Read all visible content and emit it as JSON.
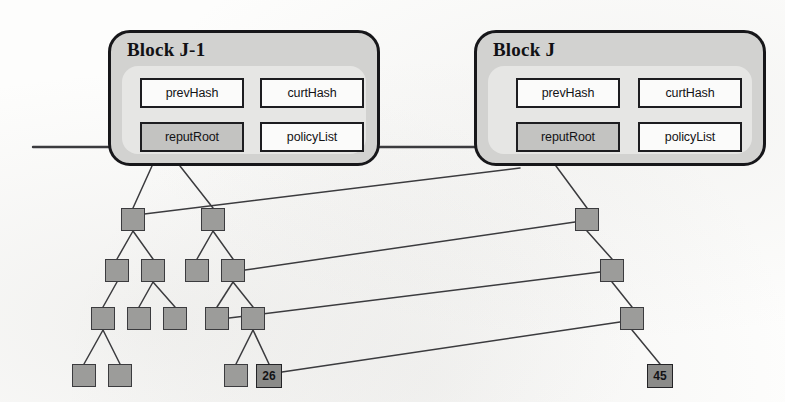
{
  "figure": {
    "kind": "blockchain-merkle-diagram",
    "background_color": "#fdfdfc",
    "line_color": "#3b3b3e",
    "node_fill": "#9c9c9a",
    "node_stroke": "#3b3b3e",
    "block_fill": "#d2d2d0",
    "block_inner_fill": "#e6e6e4",
    "block_stroke": "#17171a",
    "field_fill": "#fbfbfa",
    "field_shaded_fill": "#c3c3c1"
  },
  "blocks": [
    {
      "id": "block-j-1",
      "title": "Block J-1",
      "x": 108,
      "y": 30,
      "w": 272,
      "h": 136,
      "fields": [
        {
          "id": "prev-hash",
          "label": "prevHash",
          "x": 18,
          "y": 12,
          "w": 104,
          "h": 30,
          "shaded": false
        },
        {
          "id": "curt-hash",
          "label": "curtHash",
          "x": 138,
          "y": 12,
          "w": 104,
          "h": 30,
          "shaded": false
        },
        {
          "id": "reput-root",
          "label": "reputRoot",
          "x": 18,
          "y": 56,
          "w": 104,
          "h": 30,
          "shaded": true
        },
        {
          "id": "policy-list",
          "label": "policyList",
          "x": 138,
          "y": 56,
          "w": 104,
          "h": 30,
          "shaded": false
        }
      ]
    },
    {
      "id": "block-j",
      "title": "Block J",
      "x": 474,
      "y": 30,
      "w": 292,
      "h": 136,
      "fields": [
        {
          "id": "prev-hash",
          "label": "prevHash",
          "x": 28,
          "y": 12,
          "w": 104,
          "h": 30,
          "shaded": false
        },
        {
          "id": "curt-hash",
          "label": "curtHash",
          "x": 150,
          "y": 12,
          "w": 104,
          "h": 30,
          "shaded": false
        },
        {
          "id": "reput-root",
          "label": "reputRoot",
          "x": 28,
          "y": 56,
          "w": 104,
          "h": 30,
          "shaded": true
        },
        {
          "id": "policy-list",
          "label": "policyList",
          "x": 150,
          "y": 56,
          "w": 104,
          "h": 30,
          "shaded": false
        }
      ]
    }
  ],
  "nodes": [
    {
      "id": "L1-a",
      "x": 121,
      "y": 208,
      "w": 24,
      "h": 23,
      "label": null
    },
    {
      "id": "L1-b",
      "x": 201,
      "y": 208,
      "w": 24,
      "h": 23,
      "label": null
    },
    {
      "id": "L2-a",
      "x": 105,
      "y": 259,
      "w": 24,
      "h": 23,
      "label": null
    },
    {
      "id": "L2-b",
      "x": 141,
      "y": 259,
      "w": 24,
      "h": 23,
      "label": null
    },
    {
      "id": "L2-c",
      "x": 185,
      "y": 259,
      "w": 24,
      "h": 23,
      "label": null
    },
    {
      "id": "L2-d",
      "x": 221,
      "y": 259,
      "w": 24,
      "h": 23,
      "label": null
    },
    {
      "id": "L3-a",
      "x": 91,
      "y": 307,
      "w": 24,
      "h": 23,
      "label": null
    },
    {
      "id": "L3-b",
      "x": 127,
      "y": 307,
      "w": 24,
      "h": 23,
      "label": null
    },
    {
      "id": "L3-c",
      "x": 163,
      "y": 307,
      "w": 24,
      "h": 23,
      "label": null
    },
    {
      "id": "L3-d",
      "x": 205,
      "y": 307,
      "w": 24,
      "h": 23,
      "label": null
    },
    {
      "id": "L3-e",
      "x": 241,
      "y": 307,
      "w": 24,
      "h": 23,
      "label": null
    },
    {
      "id": "L4-a",
      "x": 72,
      "y": 364,
      "w": 24,
      "h": 23,
      "label": null
    },
    {
      "id": "L4-b",
      "x": 108,
      "y": 364,
      "w": 24,
      "h": 23,
      "label": null
    },
    {
      "id": "L4-c",
      "x": 224,
      "y": 364,
      "w": 24,
      "h": 23,
      "label": null
    },
    {
      "id": "L4-d",
      "x": 256,
      "y": 364,
      "w": 26,
      "h": 24,
      "label": "26"
    },
    {
      "id": "R1",
      "x": 575,
      "y": 208,
      "w": 24,
      "h": 23,
      "label": null
    },
    {
      "id": "R2",
      "x": 600,
      "y": 259,
      "w": 24,
      "h": 23,
      "label": null
    },
    {
      "id": "R3",
      "x": 620,
      "y": 307,
      "w": 24,
      "h": 23,
      "label": null
    },
    {
      "id": "R4",
      "x": 647,
      "y": 364,
      "w": 26,
      "h": 24,
      "label": "45"
    }
  ],
  "edges": {
    "chain_line": {
      "x1": 33,
      "y1": 147,
      "x2": 108,
      "y2": 147
    },
    "chain_link": {
      "x1": 380,
      "y1": 147,
      "x2": 474,
      "y2": 147
    },
    "root_links": [
      {
        "from": "block-j-1.reputRoot",
        "to": "L1-a",
        "x1": 152,
        "y1": 166,
        "x2": 133,
        "y2": 208
      },
      {
        "from": "block-j-1.reputRoot",
        "to": "L1-b",
        "x1": 180,
        "y1": 166,
        "x2": 213,
        "y2": 208
      },
      {
        "from": "block-j.reputRoot",
        "to": "R1",
        "x1": 556,
        "y1": 166,
        "x2": 587,
        "y2": 208
      }
    ],
    "tree_links": [
      {
        "from": "L1-a",
        "to": "L2-a"
      },
      {
        "from": "L1-a",
        "to": "L2-b"
      },
      {
        "from": "L1-b",
        "to": "L2-c"
      },
      {
        "from": "L1-b",
        "to": "L2-d"
      },
      {
        "from": "L2-a",
        "to": "L3-a"
      },
      {
        "from": "L2-b",
        "to": "L3-b"
      },
      {
        "from": "L2-b",
        "to": "L3-c"
      },
      {
        "from": "L2-d",
        "to": "L3-d"
      },
      {
        "from": "L2-d",
        "to": "L3-e"
      },
      {
        "from": "L3-a",
        "to": "L4-a"
      },
      {
        "from": "L3-a",
        "to": "L4-b"
      },
      {
        "from": "L3-e",
        "to": "L4-c"
      },
      {
        "from": "L3-e",
        "to": "L4-d"
      },
      {
        "from": "R1",
        "to": "R2"
      },
      {
        "from": "R2",
        "to": "R3"
      },
      {
        "from": "R3",
        "to": "R4"
      }
    ],
    "cross_links": [
      {
        "from": "L1-a",
        "to": "block-j.reputRoot",
        "x1": 128,
        "y1": 216,
        "x2": 520,
        "y2": 168
      },
      {
        "from": "L2-d",
        "to": "R1",
        "x1": 245,
        "y1": 270,
        "x2": 575,
        "y2": 222
      },
      {
        "from": "L3-d",
        "to": "R2",
        "x1": 229,
        "y1": 318,
        "x2": 600,
        "y2": 272
      },
      {
        "from": "L4-d",
        "to": "R3",
        "x1": 282,
        "y1": 372,
        "x2": 620,
        "y2": 322
      }
    ]
  }
}
